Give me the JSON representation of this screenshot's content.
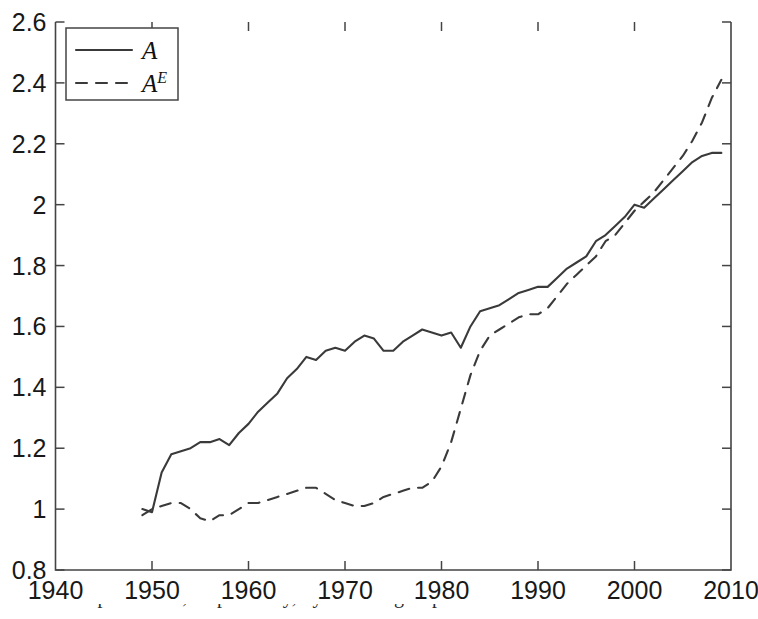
{
  "chart_data": {
    "type": "line",
    "title": "",
    "xlabel": "",
    "ylabel": "",
    "xlim": [
      1940,
      2010
    ],
    "ylim": [
      0.8,
      2.6
    ],
    "xticks": [
      1940,
      1950,
      1960,
      1970,
      1980,
      1990,
      2000,
      2010
    ],
    "xtick_labels": [
      "1940",
      "1950",
      "1960",
      "1970",
      "1980",
      "1990",
      "2000",
      "2010"
    ],
    "yticks": [
      0.8,
      1.0,
      1.2,
      1.4,
      1.6,
      1.8,
      2.0,
      2.2,
      2.4,
      2.6
    ],
    "ytick_labels": [
      "0.8",
      "1",
      "1.2",
      "1.4",
      "1.6",
      "1.8",
      "2",
      "2.2",
      "2.4",
      "2.6"
    ],
    "grid": false,
    "legend_position": "upper left",
    "legend": [
      {
        "name": "A",
        "base": "A",
        "sup": "",
        "style": "solid"
      },
      {
        "name": "A^E",
        "base": "A",
        "sup": "E",
        "style": "dashed"
      }
    ],
    "x": [
      1949,
      1950,
      1951,
      1952,
      1953,
      1954,
      1955,
      1956,
      1957,
      1958,
      1959,
      1960,
      1961,
      1962,
      1963,
      1964,
      1965,
      1966,
      1967,
      1968,
      1969,
      1970,
      1971,
      1972,
      1973,
      1974,
      1975,
      1976,
      1977,
      1978,
      1979,
      1980,
      1981,
      1982,
      1983,
      1984,
      1985,
      1986,
      1987,
      1988,
      1989,
      1990,
      1991,
      1992,
      1993,
      1994,
      1995,
      1996,
      1997,
      1998,
      1999,
      2000,
      2001,
      2002,
      2003,
      2004,
      2005,
      2006,
      2007,
      2008,
      2009
    ],
    "series": [
      {
        "name": "A",
        "style": "solid",
        "values": [
          1.0,
          0.99,
          1.12,
          1.18,
          1.19,
          1.2,
          1.22,
          1.22,
          1.23,
          1.21,
          1.25,
          1.28,
          1.32,
          1.35,
          1.38,
          1.43,
          1.46,
          1.5,
          1.49,
          1.52,
          1.53,
          1.52,
          1.55,
          1.57,
          1.56,
          1.52,
          1.52,
          1.55,
          1.57,
          1.59,
          1.58,
          1.57,
          1.58,
          1.53,
          1.6,
          1.65,
          1.66,
          1.67,
          1.69,
          1.71,
          1.72,
          1.73,
          1.73,
          1.76,
          1.79,
          1.81,
          1.83,
          1.88,
          1.9,
          1.93,
          1.96,
          2.0,
          1.99,
          2.02,
          2.05,
          2.08,
          2.11,
          2.14,
          2.16,
          2.17,
          2.17
        ]
      },
      {
        "name": "A^E",
        "style": "dashed",
        "values": [
          0.98,
          1.0,
          1.01,
          1.02,
          1.02,
          1.0,
          0.97,
          0.96,
          0.98,
          0.98,
          1.0,
          1.02,
          1.02,
          1.03,
          1.04,
          1.05,
          1.06,
          1.07,
          1.07,
          1.05,
          1.03,
          1.02,
          1.01,
          1.01,
          1.02,
          1.04,
          1.05,
          1.06,
          1.07,
          1.07,
          1.09,
          1.14,
          1.22,
          1.33,
          1.44,
          1.52,
          1.57,
          1.59,
          1.61,
          1.63,
          1.64,
          1.64,
          1.66,
          1.7,
          1.74,
          1.77,
          1.8,
          1.83,
          1.88,
          1.9,
          1.94,
          1.98,
          2.01,
          2.04,
          2.08,
          2.12,
          2.16,
          2.21,
          2.27,
          2.35,
          2.41
        ]
      }
    ]
  },
  "caption": {
    "text": "and capital/labor, respectively, by income group."
  }
}
